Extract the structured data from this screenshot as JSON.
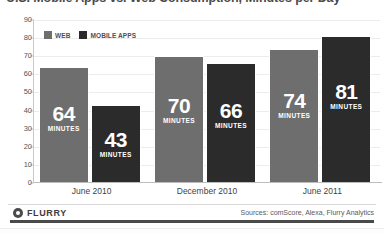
{
  "chart_data": {
    "type": "bar",
    "title": "U.S. Mobile Apps vs. Web Consumption, Minutes per Day",
    "xlabel": "",
    "ylabel": "",
    "ylim": [
      0,
      90
    ],
    "ytick_step": 10,
    "yticks": [
      "90",
      "80",
      "70",
      "60",
      "50",
      "40",
      "30",
      "20",
      "10",
      "0"
    ],
    "grid": true,
    "legend_position": "top-left",
    "categories": [
      "June 2010",
      "December 2010",
      "June 2011"
    ],
    "series": [
      {
        "name": "WEB",
        "color": "#6e6e6e",
        "values": [
          64,
          70,
          74
        ]
      },
      {
        "name": "MOBILE APPS",
        "color": "#2b2b2b",
        "values": [
          43,
          66,
          81
        ]
      }
    ],
    "value_unit_label": "MINUTES",
    "data_labels": [
      {
        "group": "June 2010",
        "series": "WEB",
        "value": "64",
        "unit": "MINUTES"
      },
      {
        "group": "June 2010",
        "series": "MOBILE APPS",
        "value": "43",
        "unit": "MINUTES"
      },
      {
        "group": "December 2010",
        "series": "WEB",
        "value": "70",
        "unit": "MINUTES"
      },
      {
        "group": "December 2010",
        "series": "MOBILE APPS",
        "value": "66",
        "unit": "MINUTES"
      },
      {
        "group": "June 2011",
        "series": "WEB",
        "value": "74",
        "unit": "MINUTES"
      },
      {
        "group": "June 2011",
        "series": "MOBILE APPS",
        "value": "81",
        "unit": "MINUTES"
      }
    ]
  },
  "legend": {
    "items": [
      {
        "label": "WEB",
        "color": "#6e6e6e"
      },
      {
        "label": "MOBILE APPS",
        "color": "#2b2b2b"
      }
    ]
  },
  "footer": {
    "brand": "FLURRY",
    "brand_icon": "flurry-circle-icon",
    "sources": "Sources: comScore, Alexa, Flurry Analytics"
  }
}
